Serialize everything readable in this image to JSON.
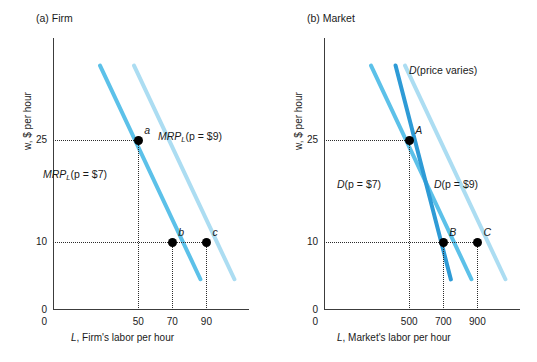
{
  "caption_remnant": "",
  "colors": {
    "axis": "#3c3c3c",
    "guide": "#2b2b2b",
    "curve_medium_blue": "#5CC1E9",
    "curve_light_blue": "#ACDDF2",
    "curve_dark_blue": "#2E9BD6",
    "point": "#000000",
    "background": "#ffffff"
  },
  "panel_a": {
    "title": "(a) Firm",
    "ylabel": "w, $ per hour",
    "xlabel_italic": "L",
    "xlabel_rest": ", Firm's labor per hour",
    "yticks": [
      "25",
      "10",
      "0"
    ],
    "ytick_values": [
      25,
      10,
      0
    ],
    "xticks": [
      "50",
      "70",
      "90"
    ],
    "xtick_values": [
      50,
      70,
      90
    ],
    "origin_label": "0",
    "curves": [
      {
        "name": "MRP_L p=7",
        "label_prefix": "MRP",
        "label_sub": "L",
        "label_suffix": "(p = $7)",
        "color_key": "curve_medium_blue",
        "points": [
          [
            28,
            36
          ],
          [
            88,
            4
          ]
        ]
      },
      {
        "name": "MRP_L p=9",
        "label_prefix": "MRP",
        "label_sub": "L",
        "label_suffix": "(p = $9)",
        "color_key": "curve_light_blue",
        "points": [
          [
            48,
            36
          ],
          [
            108,
            4
          ]
        ]
      }
    ],
    "points": [
      {
        "label": "a",
        "x": 50,
        "y": 25
      },
      {
        "label": "b",
        "x": 70,
        "y": 10
      },
      {
        "label": "c",
        "x": 90,
        "y": 10
      }
    ]
  },
  "panel_b": {
    "title": "(b) Market",
    "ylabel": "w, $ per hour",
    "xlabel_italic": "L",
    "xlabel_rest": ", Market's labor per hour",
    "yticks": [
      "25",
      "10",
      "0"
    ],
    "ytick_values": [
      25,
      10,
      0
    ],
    "xticks": [
      "500",
      "700",
      "900"
    ],
    "xtick_values": [
      500,
      700,
      900
    ],
    "origin_label": "0",
    "curves": [
      {
        "name": "D p=7",
        "label_prefix": "D",
        "label_suffix": "(p = $7)",
        "color_key": "curve_medium_blue",
        "points": [
          [
            280,
            36
          ],
          [
            880,
            4
          ]
        ]
      },
      {
        "name": "D p=9",
        "label_prefix": "D",
        "label_suffix": "(p = $9)",
        "color_key": "curve_light_blue",
        "points": [
          [
            480,
            36
          ],
          [
            1080,
            4
          ]
        ]
      },
      {
        "name": "D price varies",
        "label_prefix": "D",
        "label_suffix": "(price varies)",
        "color_key": "curve_dark_blue",
        "points": [
          [
            430,
            36
          ],
          [
            760,
            4
          ]
        ]
      }
    ],
    "points": [
      {
        "label": "A",
        "x": 500,
        "y": 25
      },
      {
        "label": "B",
        "x": 700,
        "y": 10
      },
      {
        "label": "C",
        "x": 900,
        "y": 10
      }
    ]
  },
  "chart_data": {
    "type": "line",
    "panels": [
      {
        "id": "a",
        "title": "(a) Firm",
        "xlabel": "L, Firm's labor per hour",
        "ylabel": "w, $ per hour",
        "xlim": [
          0,
          115
        ],
        "ylim": [
          0,
          40
        ],
        "xticks": [
          0,
          50,
          70,
          90
        ],
        "yticks": [
          10,
          25
        ],
        "grid": false,
        "series": [
          {
            "name": "MRP_L (p = $7)",
            "color": "#5CC1E9",
            "x": [
              28,
              88
            ],
            "y": [
              36,
              4
            ],
            "style": "solid"
          },
          {
            "name": "MRP_L (p = $9)",
            "color": "#ACDDF2",
            "x": [
              48,
              108
            ],
            "y": [
              36,
              4
            ],
            "style": "solid"
          }
        ],
        "annotations": [
          {
            "label": "a",
            "x": 50,
            "y": 25,
            "on": "MRP_L (p = $9)"
          },
          {
            "label": "b",
            "x": 70,
            "y": 10,
            "on": "MRP_L (p = $7)"
          },
          {
            "label": "c",
            "x": 90,
            "y": 10,
            "on": "MRP_L (p = $9)"
          }
        ]
      },
      {
        "id": "b",
        "title": "(b) Market",
        "xlabel": "L, Market's labor per hour",
        "ylabel": "w, $ per hour",
        "xlim": [
          0,
          1150
        ],
        "ylim": [
          0,
          40
        ],
        "xticks": [
          0,
          500,
          700,
          900
        ],
        "yticks": [
          10,
          25
        ],
        "grid": false,
        "series": [
          {
            "name": "D (p = $7)",
            "color": "#5CC1E9",
            "x": [
              280,
              880
            ],
            "y": [
              36,
              4
            ],
            "style": "solid"
          },
          {
            "name": "D (p = $9)",
            "color": "#ACDDF2",
            "x": [
              480,
              1080
            ],
            "y": [
              36,
              4
            ],
            "style": "solid"
          },
          {
            "name": "D (price varies)",
            "color": "#2E9BD6",
            "x": [
              430,
              760
            ],
            "y": [
              36,
              4
            ],
            "style": "solid"
          }
        ],
        "annotations": [
          {
            "label": "A",
            "x": 500,
            "y": 25,
            "on": "D (price varies)"
          },
          {
            "label": "B",
            "x": 700,
            "y": 10,
            "on": "D (price varies)"
          },
          {
            "label": "C",
            "x": 900,
            "y": 10,
            "on": "D (p = $9)"
          }
        ]
      }
    ],
    "legend_position": "inline-labels"
  }
}
